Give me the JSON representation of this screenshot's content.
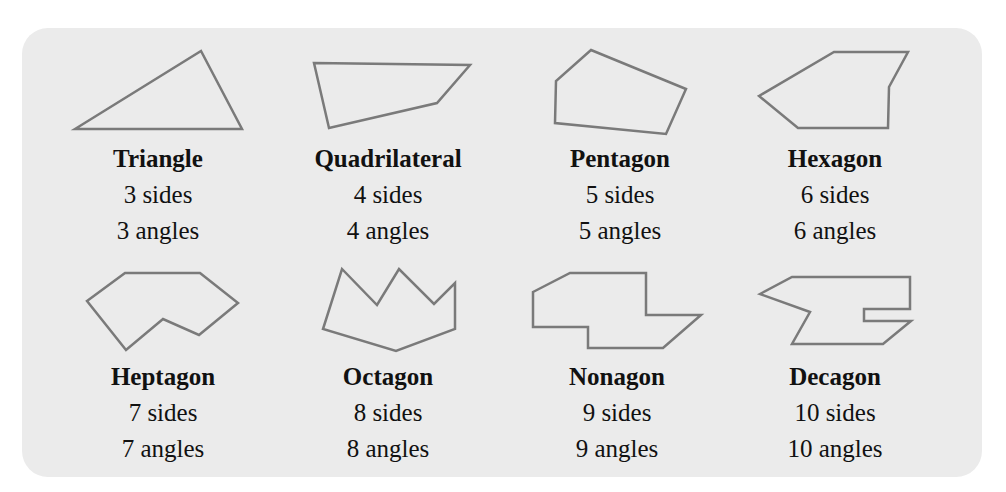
{
  "colors": {
    "panel_bg": "#ebebeb",
    "stroke": "#7a7a7a",
    "text": "#111111"
  },
  "polygons": [
    {
      "name": "Triangle",
      "sides": "3 sides",
      "angles": "3 angles",
      "points": "75,129 201,51 242,129"
    },
    {
      "name": "Quadrilateral",
      "sides": "4 sides",
      "angles": "4 angles",
      "points": "314,63 470,65 437,103 329,128"
    },
    {
      "name": "Pentagon",
      "sides": "5 sides",
      "angles": "5 angles",
      "points": "591,50 686,89 666,134 555,123 556,81"
    },
    {
      "name": "Hexagon",
      "sides": "6 sides",
      "angles": "6 angles",
      "points": "759,96 834,52 908,52 889,87 888,128 798,128"
    },
    {
      "name": "Heptagon",
      "sides": "7 sides",
      "angles": "7 angles",
      "points": "87,301 125,273 200,273 238,303 199,335 163,319 126,350"
    },
    {
      "name": "Octagon",
      "sides": "8 sides",
      "angles": "8 angles",
      "points": "342,269 377,305 399,269 434,304 455,283 455,329 396,351 323,329"
    },
    {
      "name": "Nonagon",
      "sides": "9 sides",
      "angles": "9 angles",
      "points": "533,292 570,273 646,273 646,315 701,315 663,348 588,348 588,327 533,327"
    },
    {
      "name": "Decagon",
      "sides": "10 sides",
      "angles": "10 angles",
      "points": "760,294 792,277 910,277 910,309 864,309 864,321 911,321 883,344 792,344 810,312"
    }
  ]
}
